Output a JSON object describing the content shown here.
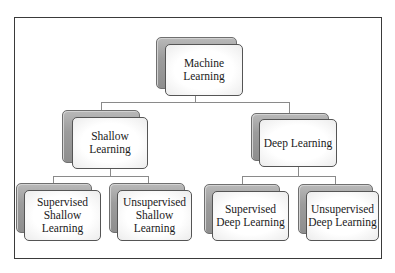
{
  "diagram": {
    "type": "hierarchy",
    "root": {
      "label": "Machine\nLearning",
      "children": [
        {
          "label": "Shallow\nLearning",
          "children": [
            {
              "label": "Supervised\nShallow\nLearning"
            },
            {
              "label": "Unsupervised\nShallow\nLearning"
            }
          ]
        },
        {
          "label": "Deep Learning",
          "children": [
            {
              "label": "Supervised\nDeep Learning"
            },
            {
              "label": "Unsupervised\nDeep Learning"
            }
          ]
        }
      ]
    }
  },
  "nodes": {
    "machine_learning": "Machine\nLearning",
    "shallow_learning": "Shallow\nLearning",
    "deep_learning": "Deep Learning",
    "supervised_shallow": "Supervised\nShallow\nLearning",
    "unsupervised_shallow": "Unsupervised\nShallow\nLearning",
    "supervised_deep": "Supervised\nDeep Learning",
    "unsupervised_deep": "Unsupervised\nDeep Learning"
  },
  "colors": {
    "frame_border": "#3a3a3a",
    "connector": "#8a8a8a",
    "box_border": "#555555",
    "shadow_box": "#9c9c9c",
    "box_fill": "#ffffff"
  }
}
